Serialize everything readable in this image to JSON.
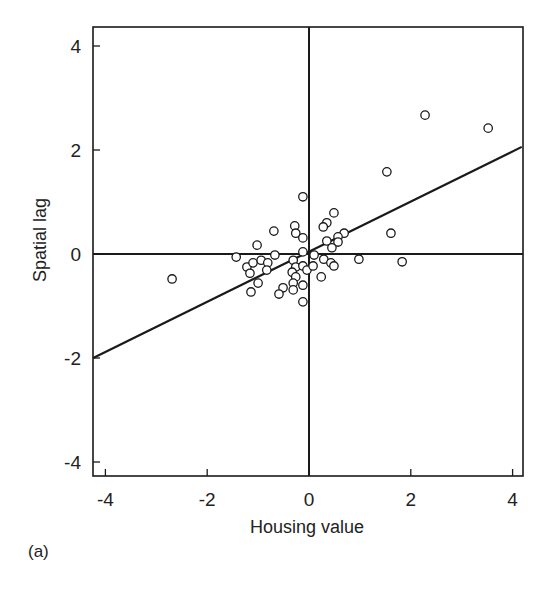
{
  "chart_data": {
    "type": "scatter",
    "title": "",
    "panel_label": "(a)",
    "xlabel": "Housing value",
    "ylabel": "Spatial lag",
    "xlim": [
      -4.3,
      4.2
    ],
    "ylim": [
      -4.3,
      4.3
    ],
    "xticks": [
      -4,
      -2,
      0,
      2,
      4
    ],
    "yticks": [
      -4,
      -2,
      0,
      2,
      4
    ],
    "xtick_labels": [
      "-4",
      "-2",
      "0",
      "2",
      "4"
    ],
    "ytick_labels": [
      "-4",
      "-2",
      "0",
      "2",
      "4"
    ],
    "grid": false,
    "legend": null,
    "reference_lines": [
      {
        "orientation": "vertical",
        "value": 0
      },
      {
        "orientation": "horizontal",
        "value": 0
      }
    ],
    "fit_line": {
      "x": [
        -4.24,
        4.18
      ],
      "y": [
        -2.0,
        2.06
      ],
      "slope": 0.48,
      "intercept": 0.03
    },
    "series": [
      {
        "name": "Observations",
        "marker": "open-circle",
        "points": [
          [
            3.52,
            2.42
          ],
          [
            2.28,
            2.67
          ],
          [
            1.53,
            1.58
          ],
          [
            1.61,
            0.4
          ],
          [
            1.83,
            -0.15
          ],
          [
            0.98,
            -0.1
          ],
          [
            -2.69,
            -0.48
          ],
          [
            -1.43,
            -0.06
          ],
          [
            -0.69,
            0.44
          ],
          [
            -1.02,
            0.17
          ],
          [
            -0.67,
            -0.02
          ],
          [
            -1.22,
            -0.25
          ],
          [
            -1.1,
            -0.17
          ],
          [
            -0.94,
            -0.12
          ],
          [
            -0.81,
            -0.17
          ],
          [
            -1.16,
            -0.37
          ],
          [
            -0.83,
            -0.31
          ],
          [
            -1.0,
            -0.56
          ],
          [
            -1.14,
            -0.73
          ],
          [
            -0.51,
            -0.65
          ],
          [
            -0.59,
            -0.77
          ],
          [
            -0.12,
            1.1
          ],
          [
            -0.28,
            0.54
          ],
          [
            -0.26,
            0.4
          ],
          [
            -0.12,
            0.31
          ],
          [
            -0.12,
            0.04
          ],
          [
            -0.31,
            -0.12
          ],
          [
            -0.26,
            -0.25
          ],
          [
            -0.12,
            -0.23
          ],
          [
            -0.04,
            -0.31
          ],
          [
            -0.33,
            -0.35
          ],
          [
            -0.26,
            -0.44
          ],
          [
            -0.31,
            -0.56
          ],
          [
            -0.12,
            -0.6
          ],
          [
            -0.31,
            -0.69
          ],
          [
            -0.12,
            -0.92
          ],
          [
            0.49,
            0.79
          ],
          [
            0.35,
            0.6
          ],
          [
            0.28,
            0.52
          ],
          [
            0.69,
            0.4
          ],
          [
            0.57,
            0.33
          ],
          [
            0.57,
            0.23
          ],
          [
            0.35,
            0.25
          ],
          [
            0.45,
            0.12
          ],
          [
            0.1,
            -0.02
          ],
          [
            0.29,
            -0.1
          ],
          [
            0.43,
            -0.17
          ],
          [
            0.49,
            -0.23
          ],
          [
            0.08,
            -0.23
          ],
          [
            0.24,
            -0.44
          ]
        ]
      }
    ]
  },
  "layout": {
    "box": {
      "left": 93,
      "top": 27,
      "right": 523,
      "bottom": 476
    },
    "origin_px": {
      "x": 309,
      "y": 254
    },
    "px_per_unit": {
      "x": 50.9,
      "y": 52.0
    },
    "line_color": "#1a1a1a",
    "marker_color": "#1a1a1a"
  }
}
